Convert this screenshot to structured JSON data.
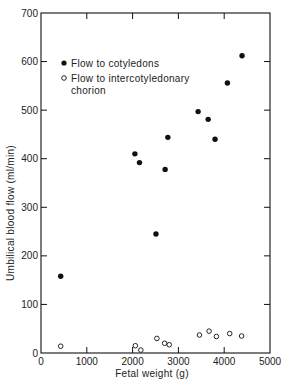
{
  "chart_data": {
    "type": "scatter",
    "title": "",
    "xlabel": "Fetal weight (g)",
    "ylabel": "Umbilical blood flow (ml/min)",
    "xlim": [
      0,
      5000
    ],
    "ylim": [
      0,
      700
    ],
    "xticks": [
      0,
      1000,
      2000,
      3000,
      4000,
      5000
    ],
    "yticks": [
      0,
      100,
      200,
      300,
      400,
      500,
      600,
      700
    ],
    "grid": false,
    "legend_position": "upper-left",
    "series": [
      {
        "name": "Flow to cotyledons",
        "marker": "filled-circle",
        "points": [
          {
            "x": 430,
            "y": 158
          },
          {
            "x": 2050,
            "y": 410
          },
          {
            "x": 2150,
            "y": 392
          },
          {
            "x": 2510,
            "y": 245
          },
          {
            "x": 2710,
            "y": 378
          },
          {
            "x": 2770,
            "y": 444
          },
          {
            "x": 3430,
            "y": 497
          },
          {
            "x": 3650,
            "y": 481
          },
          {
            "x": 3800,
            "y": 440
          },
          {
            "x": 4070,
            "y": 556
          },
          {
            "x": 4390,
            "y": 612
          }
        ]
      },
      {
        "name": "Flow to intercotyledonary chorion",
        "marker": "open-circle",
        "points": [
          {
            "x": 430,
            "y": 14
          },
          {
            "x": 2060,
            "y": 15
          },
          {
            "x": 2180,
            "y": 6
          },
          {
            "x": 2530,
            "y": 30
          },
          {
            "x": 2700,
            "y": 20
          },
          {
            "x": 2800,
            "y": 17
          },
          {
            "x": 3460,
            "y": 37
          },
          {
            "x": 3670,
            "y": 45
          },
          {
            "x": 3830,
            "y": 34
          },
          {
            "x": 4120,
            "y": 40
          },
          {
            "x": 4380,
            "y": 35
          }
        ]
      }
    ]
  },
  "legend": {
    "line1": "Flow to cotyledons",
    "line2a": "Flow to intercotyledonary",
    "line2b": "chorion"
  }
}
